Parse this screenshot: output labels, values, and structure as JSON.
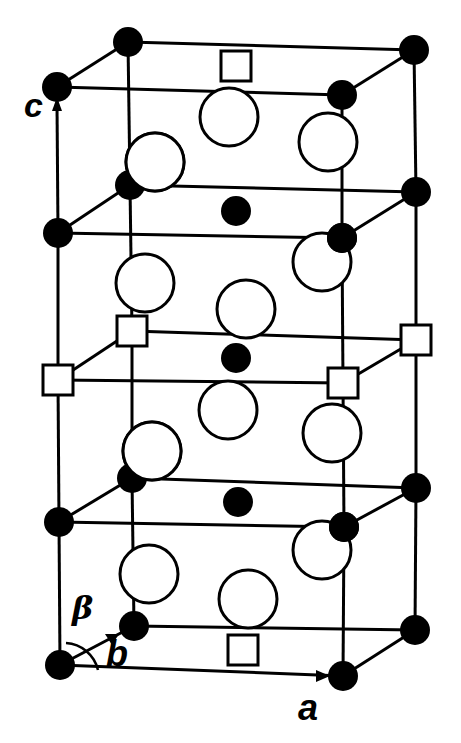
{
  "figure": {
    "type": "crystal unit cell",
    "axis_labels": {
      "c": "c",
      "b": "b",
      "beta": "β",
      "a": "a"
    },
    "legend_note": "filled circles = small atoms; open large circles = large atoms; open squares = vacancy/site",
    "colors": {
      "line": "#000000",
      "filled": "#000000",
      "open_fill": "#ffffff"
    }
  },
  "geometry": {
    "levels": [
      {
        "name": "top",
        "fl": [
          57,
          87
        ],
        "bl": [
          128,
          42
        ],
        "br": [
          414,
          50
        ],
        "fr": [
          342,
          95
        ]
      },
      {
        "name": "upper",
        "fl": [
          58,
          233
        ],
        "bl": [
          130,
          185
        ],
        "br": [
          416,
          192
        ],
        "fr": [
          342,
          238
        ]
      },
      {
        "name": "middle",
        "fl": [
          58,
          380
        ],
        "bl": [
          132,
          331
        ],
        "br": [
          416,
          340
        ],
        "fr": [
          343,
          383
        ]
      },
      {
        "name": "lower",
        "fl": [
          59,
          522
        ],
        "bl": [
          132,
          478
        ],
        "br": [
          416,
          488
        ],
        "fr": [
          344,
          527
        ]
      },
      {
        "name": "bottom",
        "fl": [
          60,
          665
        ],
        "bl": [
          134,
          626
        ],
        "br": [
          415,
          630
        ],
        "fr": [
          343,
          676
        ]
      }
    ],
    "corner_kinds": [
      "filled",
      "filled",
      "square",
      "filled",
      "filled"
    ],
    "large_circles": [
      [
        229,
        117
      ],
      [
        328,
        142
      ],
      [
        155,
        162
      ],
      [
        322,
        262
      ],
      [
        145,
        283
      ],
      [
        246,
        309
      ],
      [
        228,
        410
      ],
      [
        332,
        433
      ],
      [
        152,
        451
      ],
      [
        322,
        550
      ],
      [
        149,
        574
      ],
      [
        248,
        599
      ]
    ],
    "center_dots": [
      [
        236,
        211
      ],
      [
        236,
        358
      ],
      [
        238,
        502
      ]
    ],
    "center_squares": [
      [
        236,
        66
      ],
      [
        243,
        650
      ]
    ]
  }
}
